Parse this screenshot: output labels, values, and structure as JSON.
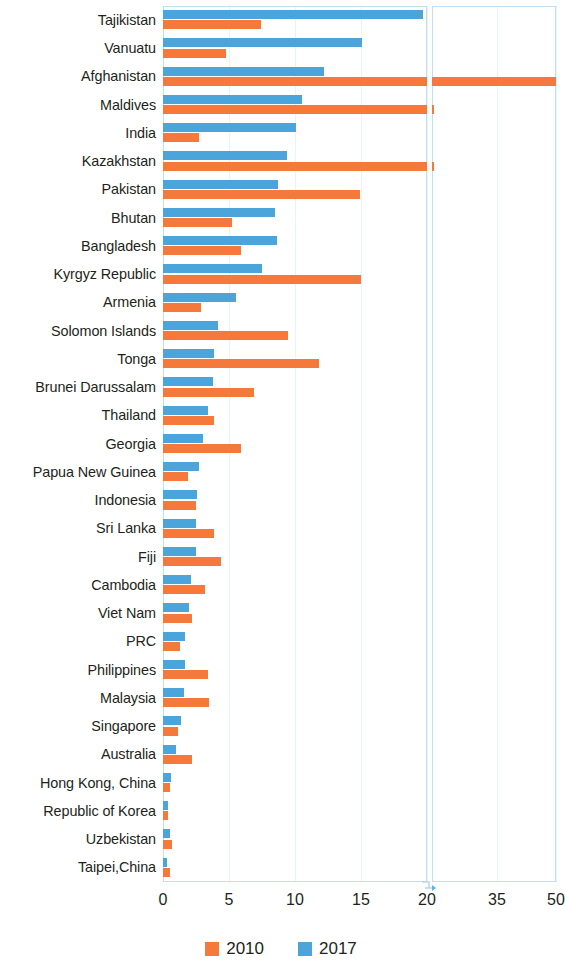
{
  "chart_data": {
    "type": "bar",
    "orientation": "horizontal",
    "title": "",
    "subtitle": "",
    "xlabel": "",
    "ylabel": "",
    "grid": true,
    "legend_position": "bottom",
    "axis_break": {
      "present": true,
      "after": 20,
      "resumes_at": 20,
      "note": "x-axis is broken after 20; remaining ticks are 35 and 50"
    },
    "xticks": [
      0,
      5,
      10,
      15,
      20,
      35,
      50
    ],
    "xtick_labels": [
      "0",
      "5",
      "10",
      "15",
      "20",
      "35",
      "50"
    ],
    "xlim": [
      0,
      50
    ],
    "categories": [
      "Tajikistan",
      "Vanuatu",
      "Afghanistan",
      "Maldives",
      "India",
      "Kazakhstan",
      "Pakistan",
      "Bhutan",
      "Bangladesh",
      "Kyrgyz Republic",
      "Armenia",
      "Solomon Islands",
      "Tonga",
      "Brunei Darussalam",
      "Thailand",
      "Georgia",
      "Papua New Guinea",
      "Indonesia",
      "Sri Lanka",
      "Fiji",
      "Cambodia",
      "Viet Nam",
      "PRC",
      "Philippines",
      "Malaysia",
      "Singapore",
      "Australia",
      "Hong Kong, China",
      "Republic of Korea",
      "Uzbekistan",
      "Taipei,China"
    ],
    "series": [
      {
        "name": "2010",
        "color": "#f4793a",
        "values": [
          7.4,
          4.8,
          50.0,
          20.5,
          2.7,
          20.5,
          14.9,
          5.2,
          5.9,
          15.0,
          2.9,
          9.5,
          11.8,
          6.9,
          3.9,
          5.9,
          1.9,
          2.5,
          3.9,
          4.4,
          3.2,
          2.2,
          1.3,
          3.4,
          3.5,
          1.1,
          2.2,
          0.5,
          0.4,
          0.7,
          0.5
        ]
      },
      {
        "name": "2017",
        "color": "#4ba5db",
        "values": [
          19.7,
          15.1,
          12.2,
          10.5,
          10.1,
          9.4,
          8.7,
          8.5,
          8.6,
          7.5,
          5.5,
          4.2,
          3.9,
          3.8,
          3.4,
          3.0,
          2.7,
          2.6,
          2.5,
          2.5,
          2.1,
          2.0,
          1.7,
          1.7,
          1.6,
          1.4,
          1.0,
          0.6,
          0.4,
          0.5,
          0.3
        ]
      }
    ]
  },
  "legend": {
    "items": [
      {
        "label": "2010",
        "color": "#f4793a"
      },
      {
        "label": "2017",
        "color": "#4ba5db"
      }
    ]
  },
  "colors": {
    "series_2010": "#f4793a",
    "series_2017": "#4ba5db",
    "grid": "#e9f3fa",
    "panel_border": "#bfe0f2",
    "text": "#231f20"
  }
}
